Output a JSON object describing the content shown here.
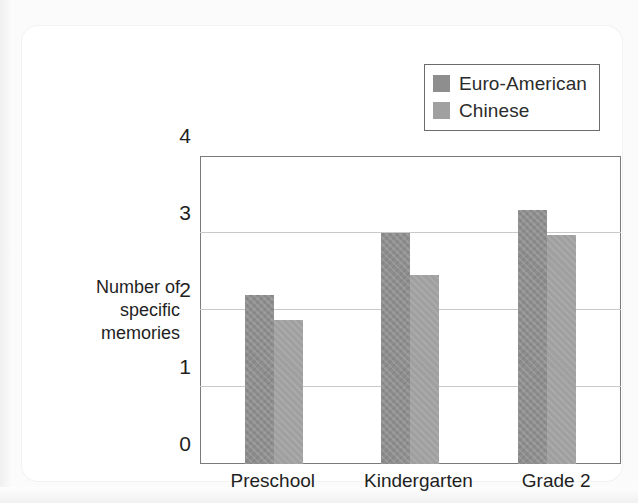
{
  "figure": {
    "y_axis_title_lines": [
      "Number of",
      "specific",
      "memories"
    ]
  },
  "legend": {
    "entries": [
      {
        "label": "Euro-American",
        "color": "#8e8e8e",
        "swatch_name": "legend-swatch-euro-american"
      },
      {
        "label": "Chinese",
        "color": "#a0a0a0",
        "swatch_name": "legend-swatch-chinese"
      }
    ]
  },
  "chart_data": {
    "type": "bar",
    "title": "",
    "xlabel": "",
    "ylabel": "Number of specific memories",
    "categories": [
      "Preschool",
      "Kindergarten",
      "Grade 2"
    ],
    "series": [
      {
        "name": "Euro-American",
        "color": "#8e8e8e",
        "values": [
          2.2,
          3.0,
          3.3
        ]
      },
      {
        "name": "Chinese",
        "color": "#a0a0a0",
        "values": [
          1.87,
          2.45,
          2.97
        ]
      }
    ],
    "ylim": [
      0,
      4
    ],
    "ytick_labels": [
      "0",
      "1",
      "2",
      "3",
      "4"
    ],
    "ytick_values": [
      0,
      1,
      2,
      3,
      4
    ],
    "gridlines_at": [
      1,
      2,
      3
    ],
    "grid": true,
    "legend_position": "top-right"
  }
}
